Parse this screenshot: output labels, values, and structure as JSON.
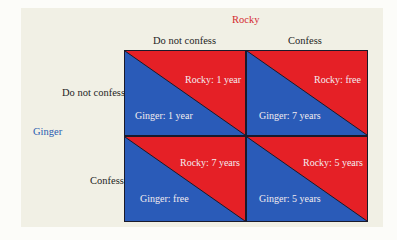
{
  "colors": {
    "rocky": "#e52026",
    "ginger": "#2a5bb8",
    "panel_bg": "#f1f0e5",
    "page_bg": "#fcfcf9",
    "grid_line": "#1a1a2a"
  },
  "column_player": {
    "label": "Rocky"
  },
  "row_player": {
    "label": "Ginger"
  },
  "columns": [
    {
      "label": "Do not confess"
    },
    {
      "label": "Confess"
    }
  ],
  "rows": [
    {
      "label": "Do not confess"
    },
    {
      "label": "Confess"
    }
  ],
  "cells": [
    [
      {
        "rocky": "Rocky: 1 year",
        "ginger": "Ginger: 1 year"
      },
      {
        "rocky": "Rocky: free",
        "ginger": "Ginger: 7 years"
      }
    ],
    [
      {
        "rocky": "Rocky: 7 years",
        "ginger": "Ginger: free"
      },
      {
        "rocky": "Rocky: 5 years",
        "ginger": "Ginger: 5 years"
      }
    ]
  ]
}
